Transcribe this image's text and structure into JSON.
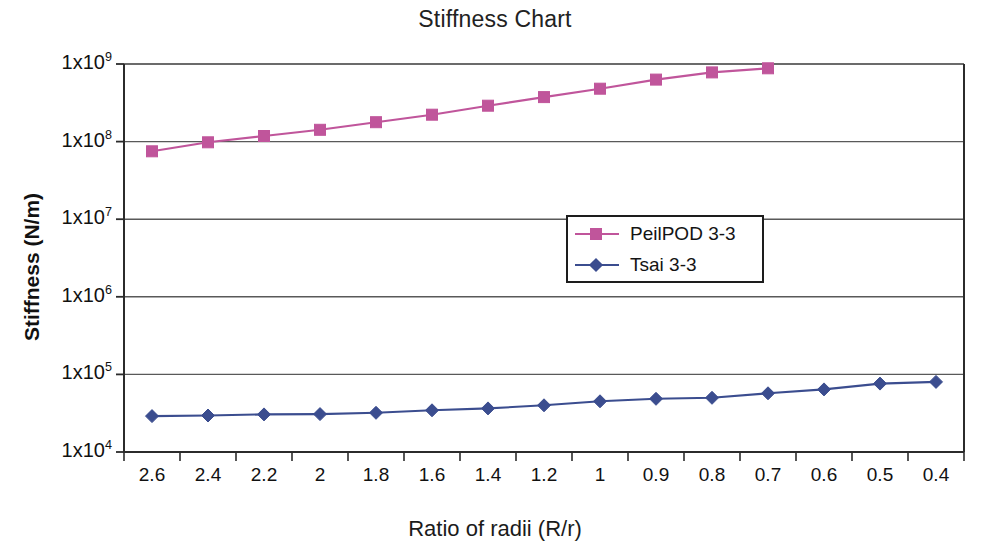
{
  "chart_data": {
    "type": "line",
    "title": "Stiffness Chart",
    "xlabel": "Ratio of radii (R/r)",
    "ylabel": "Stiffness (N/m)",
    "yscale": "log",
    "ylim": [
      10000,
      1000000000
    ],
    "ytick_labels": [
      "1x10^9",
      "1x10^8",
      "1x10^7",
      "1x10^6",
      "1x10^5",
      "1x10^4"
    ],
    "ytick_mantissas": [
      "1x10",
      "1x10",
      "1x10",
      "1x10",
      "1x10",
      "1x10"
    ],
    "ytick_exponents": [
      "9",
      "8",
      "7",
      "6",
      "5",
      "4"
    ],
    "ytick_values": [
      1000000000,
      100000000,
      10000000,
      1000000,
      100000,
      10000
    ],
    "grid": "horizontal",
    "legend_position": "center",
    "categories": [
      "2.6",
      "2.4",
      "2.2",
      "2",
      "1.8",
      "1.6",
      "1.4",
      "1.2",
      "1",
      "0.9",
      "0.8",
      "0.7",
      "0.6",
      "0.5",
      "0.4"
    ],
    "series": [
      {
        "name": "PeilPOD 3-3",
        "color": "#c0559b",
        "marker": "square",
        "values": [
          75000000,
          98000000,
          118000000,
          142000000,
          178000000,
          222000000,
          290000000,
          375000000,
          480000000,
          630000000,
          780000000,
          880000000,
          null,
          null,
          null
        ]
      },
      {
        "name": "Tsai 3-3",
        "color": "#3b4d8f",
        "marker": "diamond",
        "values": [
          29000,
          29500,
          30500,
          30800,
          32000,
          34500,
          36500,
          40000,
          45000,
          48500,
          50000,
          57000,
          64000,
          76000,
          80000
        ]
      }
    ]
  },
  "legend": {
    "items": [
      {
        "label": "PeilPOD 3-3"
      },
      {
        "label": "Tsai 3-3"
      }
    ]
  }
}
